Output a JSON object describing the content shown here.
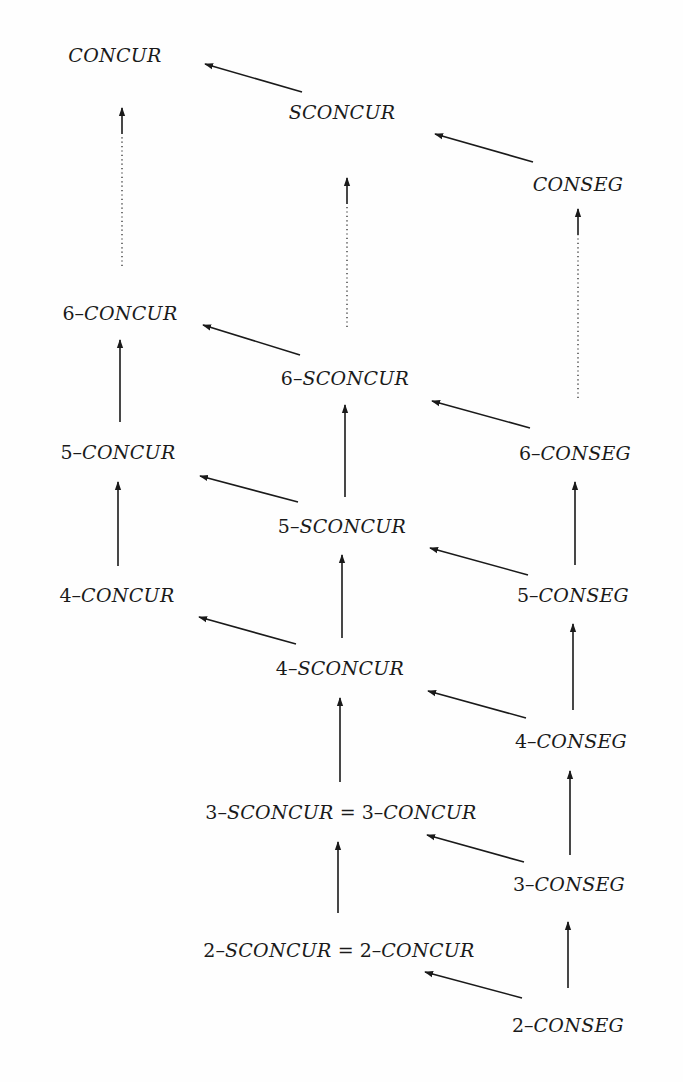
{
  "diagram": {
    "type": "hierarchy-lattice",
    "colors": {
      "ink": "#1a1a1a",
      "background": "#fefefe"
    },
    "nodes": [
      {
        "id": "concur",
        "prefix": "",
        "name": "CONCUR",
        "suffix": "",
        "x": 115,
        "y": 55
      },
      {
        "id": "sconcur",
        "prefix": "",
        "name": "SCONCUR",
        "suffix": "",
        "x": 342,
        "y": 112
      },
      {
        "id": "conseg",
        "prefix": "",
        "name": "CONSEG",
        "suffix": "",
        "x": 578,
        "y": 184
      },
      {
        "id": "6-concur",
        "prefix": "6–",
        "name": "CONCUR",
        "suffix": "",
        "x": 120,
        "y": 313
      },
      {
        "id": "6-sconcur",
        "prefix": "6–",
        "name": "SCONCUR",
        "suffix": "",
        "x": 345,
        "y": 378
      },
      {
        "id": "6-conseg",
        "prefix": "6–",
        "name": "CONSEG",
        "suffix": "",
        "x": 575,
        "y": 453
      },
      {
        "id": "5-concur",
        "prefix": "5–",
        "name": "CONCUR",
        "suffix": "",
        "x": 118,
        "y": 452
      },
      {
        "id": "5-sconcur",
        "prefix": "5–",
        "name": "SCONCUR",
        "suffix": "",
        "x": 342,
        "y": 526
      },
      {
        "id": "5-conseg",
        "prefix": "5–",
        "name": "CONSEG",
        "suffix": "",
        "x": 573,
        "y": 595
      },
      {
        "id": "4-concur",
        "prefix": "4–",
        "name": "CONCUR",
        "suffix": "",
        "x": 117,
        "y": 595
      },
      {
        "id": "4-sconcur",
        "prefix": "4–",
        "name": "SCONCUR",
        "suffix": "",
        "x": 340,
        "y": 668
      },
      {
        "id": "4-conseg",
        "prefix": "4–",
        "name": "CONSEG",
        "suffix": "",
        "x": 571,
        "y": 741
      },
      {
        "id": "3-sconcur-eq-3-concur",
        "prefix": "3–",
        "name": "SCONCUR",
        "suffix": " = 3–",
        "name2": "CONCUR",
        "x": 341,
        "y": 812
      },
      {
        "id": "3-conseg",
        "prefix": "3–",
        "name": "CONSEG",
        "suffix": "",
        "x": 569,
        "y": 884
      },
      {
        "id": "2-sconcur-eq-2-concur",
        "prefix": "2–",
        "name": "SCONCUR",
        "suffix": " = 2–",
        "name2": "CONCUR",
        "x": 339,
        "y": 950
      },
      {
        "id": "2-conseg",
        "prefix": "2–",
        "name": "CONSEG",
        "suffix": "",
        "x": 568,
        "y": 1025
      }
    ],
    "edges": [
      {
        "from": "sconcur",
        "to": "concur",
        "style": "solid",
        "x1": 302,
        "y1": 92,
        "x2": 205,
        "y2": 64
      },
      {
        "from": "conseg",
        "to": "sconcur",
        "style": "solid",
        "x1": 533,
        "y1": 162,
        "x2": 435,
        "y2": 134
      },
      {
        "from": "6-concur",
        "to": "concur",
        "style": "dotted",
        "x1": 122,
        "y1": 266,
        "x2": 122,
        "y2": 108
      },
      {
        "from": "6-sconcur",
        "to": "sconcur",
        "style": "dotted",
        "x1": 347,
        "y1": 327,
        "x2": 347,
        "y2": 178
      },
      {
        "from": "6-conseg",
        "to": "conseg",
        "style": "dotted",
        "x1": 578,
        "y1": 398,
        "x2": 578,
        "y2": 209
      },
      {
        "from": "6-sconcur",
        "to": "6-concur",
        "style": "solid",
        "x1": 300,
        "y1": 355,
        "x2": 203,
        "y2": 325
      },
      {
        "from": "6-conseg",
        "to": "6-sconcur",
        "style": "solid",
        "x1": 530,
        "y1": 428,
        "x2": 432,
        "y2": 401
      },
      {
        "from": "5-concur",
        "to": "6-concur",
        "style": "solid",
        "x1": 120,
        "y1": 422,
        "x2": 120,
        "y2": 340
      },
      {
        "from": "5-sconcur",
        "to": "6-sconcur",
        "style": "solid",
        "x1": 345,
        "y1": 497,
        "x2": 345,
        "y2": 405
      },
      {
        "from": "5-conseg",
        "to": "6-conseg",
        "style": "solid",
        "x1": 575,
        "y1": 565,
        "x2": 575,
        "y2": 482
      },
      {
        "from": "5-sconcur",
        "to": "5-concur",
        "style": "solid",
        "x1": 298,
        "y1": 502,
        "x2": 200,
        "y2": 476
      },
      {
        "from": "5-conseg",
        "to": "5-sconcur",
        "style": "solid",
        "x1": 528,
        "y1": 575,
        "x2": 430,
        "y2": 548
      },
      {
        "from": "4-concur",
        "to": "5-concur",
        "style": "solid",
        "x1": 118,
        "y1": 566,
        "x2": 118,
        "y2": 482
      },
      {
        "from": "4-sconcur",
        "to": "5-sconcur",
        "style": "solid",
        "x1": 342,
        "y1": 638,
        "x2": 342,
        "y2": 555
      },
      {
        "from": "4-conseg",
        "to": "5-conseg",
        "style": "solid",
        "x1": 573,
        "y1": 710,
        "x2": 573,
        "y2": 624
      },
      {
        "from": "4-sconcur",
        "to": "4-concur",
        "style": "solid",
        "x1": 296,
        "y1": 644,
        "x2": 199,
        "y2": 617
      },
      {
        "from": "4-conseg",
        "to": "4-sconcur",
        "style": "solid",
        "x1": 526,
        "y1": 718,
        "x2": 428,
        "y2": 691
      },
      {
        "from": "3-sconcur-eq-3-concur",
        "to": "4-sconcur",
        "style": "solid",
        "x1": 340,
        "y1": 782,
        "x2": 340,
        "y2": 698
      },
      {
        "from": "3-conseg",
        "to": "4-conseg",
        "style": "solid",
        "x1": 570,
        "y1": 855,
        "x2": 570,
        "y2": 771
      },
      {
        "from": "3-conseg",
        "to": "3-sconcur-eq-3-concur",
        "style": "solid",
        "x1": 524,
        "y1": 862,
        "x2": 427,
        "y2": 835
      },
      {
        "from": "2-sconcur-eq-2-concur",
        "to": "3-sconcur-eq-3-concur",
        "style": "solid",
        "x1": 338,
        "y1": 913,
        "x2": 338,
        "y2": 842
      },
      {
        "from": "2-conseg",
        "to": "3-conseg",
        "style": "solid",
        "x1": 568,
        "y1": 988,
        "x2": 568,
        "y2": 922
      },
      {
        "from": "2-conseg",
        "to": "2-sconcur-eq-2-concur",
        "style": "solid",
        "x1": 522,
        "y1": 998,
        "x2": 425,
        "y2": 972
      }
    ]
  }
}
